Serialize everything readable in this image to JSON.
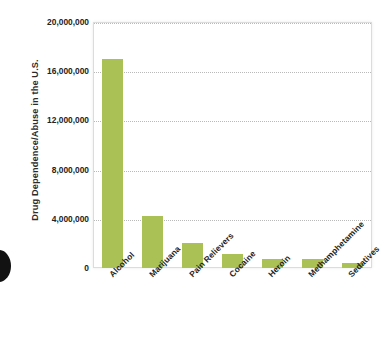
{
  "artifacts": {
    "bleed_text": "",
    "binding_mark_name": "page-binding-mark"
  },
  "chart_data": {
    "type": "bar",
    "title": "",
    "xlabel": "",
    "ylabel": "Drug Dependence/Abuse in the U.S.",
    "categories": [
      "Alcohol",
      "Marijuana",
      "Pain Relievers",
      "Cocaine",
      "Heroin",
      "Methamphetamine",
      "Sedatives"
    ],
    "values": [
      17000000,
      4200000,
      2000000,
      1100000,
      730000,
      730000,
      400000
    ],
    "ylim": [
      0,
      20000000
    ],
    "ytick_values": [
      0,
      4000000,
      8000000,
      12000000,
      16000000,
      20000000
    ],
    "ytick_labels": [
      "0",
      "4,000,000",
      "8,000,000",
      "12,000,000",
      "16,000,000",
      "20,000,000"
    ],
    "grid": true,
    "gridline_style": "dotted",
    "legend": null,
    "bar_color": "#a9c155",
    "plot_border_color": "#dcdcdc",
    "background_color": "#ffffff"
  }
}
